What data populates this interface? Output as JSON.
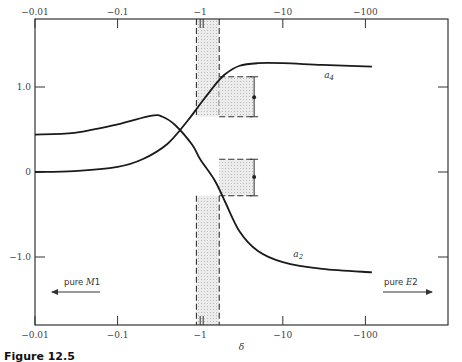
{
  "chart_data": {
    "type": "line",
    "title": "",
    "xlabel": "δ",
    "ylabel": "",
    "x_scale": "log (negative δ)",
    "x_ticks": [
      {
        "value": -0.01,
        "label": "−0.01"
      },
      {
        "value": -0.1,
        "label": "−0.1"
      },
      {
        "value": -1,
        "label": "−1"
      },
      {
        "value": -10,
        "label": "−10"
      },
      {
        "value": -100,
        "label": "−100"
      }
    ],
    "y_ticks": [
      {
        "value": 1.0,
        "label": "1.0"
      },
      {
        "value": 0,
        "label": "0"
      },
      {
        "value": -1.0,
        "label": "−1.0"
      }
    ],
    "xlim_abs": [
      0.01,
      1000
    ],
    "ylim": [
      -1.8,
      1.8
    ],
    "grid": false,
    "series": [
      {
        "name": "a4",
        "label": "a",
        "subscript": "4",
        "points": [
          [
            0.01,
            0.0
          ],
          [
            0.03,
            0.01
          ],
          [
            0.1,
            0.06
          ],
          [
            0.2,
            0.15
          ],
          [
            0.4,
            0.33
          ],
          [
            0.7,
            0.6
          ],
          [
            1.0,
            0.8
          ],
          [
            1.5,
            1.02
          ],
          [
            2.0,
            1.15
          ],
          [
            3.0,
            1.25
          ],
          [
            5.0,
            1.28
          ],
          [
            10.0,
            1.28
          ],
          [
            30.0,
            1.26
          ],
          [
            120.0,
            1.24
          ]
        ]
      },
      {
        "name": "a2",
        "label": "a",
        "subscript": "2",
        "points": [
          [
            0.01,
            0.44
          ],
          [
            0.03,
            0.46
          ],
          [
            0.1,
            0.56
          ],
          [
            0.25,
            0.66
          ],
          [
            0.35,
            0.65
          ],
          [
            0.5,
            0.55
          ],
          [
            0.8,
            0.32
          ],
          [
            1.0,
            0.15
          ],
          [
            1.5,
            -0.1
          ],
          [
            2.0,
            -0.35
          ],
          [
            3.0,
            -0.7
          ],
          [
            5.0,
            -0.93
          ],
          [
            10.0,
            -1.06
          ],
          [
            30.0,
            -1.14
          ],
          [
            120.0,
            -1.18
          ]
        ]
      }
    ],
    "bands": [
      {
        "name": "delta-range",
        "x_abs": [
          0.9,
          1.7
        ],
        "y_top_region": [
          0.65,
          1.8
        ],
        "y_bottom_region": [
          -1.8,
          -0.28
        ]
      }
    ],
    "boxes": [
      {
        "name": "a4-range",
        "x_abs": [
          1.7,
          4.5
        ],
        "y": [
          0.65,
          1.12
        ]
      },
      {
        "name": "a2-range",
        "x_abs": [
          1.7,
          4.5
        ],
        "y": [
          -0.28,
          0.15
        ]
      }
    ],
    "error_points": [
      {
        "name": "a4-measured",
        "x_abs": 4.5,
        "y": 0.88,
        "y_err": [
          0.65,
          1.12
        ]
      },
      {
        "name": "a2-measured",
        "x_abs": 4.5,
        "y": -0.06,
        "y_err": [
          -0.28,
          0.15
        ]
      }
    ],
    "annotations": [
      {
        "text_plain": "pure ",
        "text_italic": "M",
        "text_suffix": "1",
        "direction": "left",
        "placement": "bottom-left"
      },
      {
        "text_plain": "pure ",
        "text_italic": "E",
        "text_suffix": "2",
        "direction": "right",
        "placement": "bottom-right"
      }
    ]
  },
  "caption": {
    "label": "Figure 12.5",
    "text": "Angular distribution coefficients"
  }
}
